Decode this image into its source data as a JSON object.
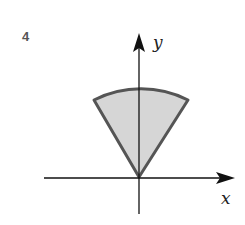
{
  "problem_number": "4",
  "axes": {
    "x_label": "x",
    "y_label": "y"
  },
  "region": {
    "shape": "circular sector",
    "fill": "#d6d6d6",
    "stroke": "#555555"
  },
  "colors": {
    "axis": "#111111"
  }
}
